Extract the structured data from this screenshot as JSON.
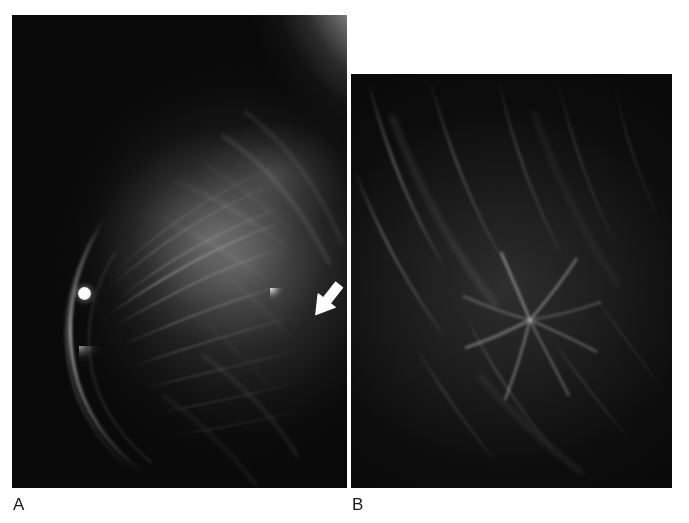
{
  "figure": {
    "type": "medical-imaging-figure",
    "modality": "Mammography",
    "background_color": "#ffffff",
    "panel_count": 2
  },
  "panels": [
    {
      "id": "A",
      "label": "A",
      "view_description": "Full-field mammogram of the breast, oblique projection",
      "background_color": "#050505",
      "annotations": [
        {
          "name": "arrow-marker",
          "icon": "arrow-icon",
          "color": "#ffffff",
          "direction": "down-left",
          "points_to": "spiculated mass in the posterior breast",
          "x": 316,
          "y": 284
        },
        {
          "name": "radiopaque-skin-marker",
          "icon": "circle-marker-icon",
          "color": "#ffffff",
          "shape": "round",
          "x": 78,
          "y": 284
        }
      ],
      "features": [
        "bright pectoral/chest-wall density in the upper right",
        "fibroglandular fanning trabecular strands",
        "curved anterior skin line along the left margin",
        "small high-density spiculated lesion indicated by the arrow"
      ]
    },
    {
      "id": "B",
      "label": "B",
      "view_description": "Magnified spot-compression view of the lesion",
      "background_color": "#050505",
      "features": [
        "central spiculated mass with architectural distortion",
        "radiating linear spicules extending into surrounding fat",
        "diagonal fibrous bands crossing the field"
      ]
    }
  ],
  "colors": {
    "page_background": "#ffffff",
    "film_black": "#050505",
    "annotation_white": "#ffffff",
    "label_text": "#1a1a1a"
  },
  "labels": {
    "panel_a": "A",
    "panel_b": "B"
  }
}
